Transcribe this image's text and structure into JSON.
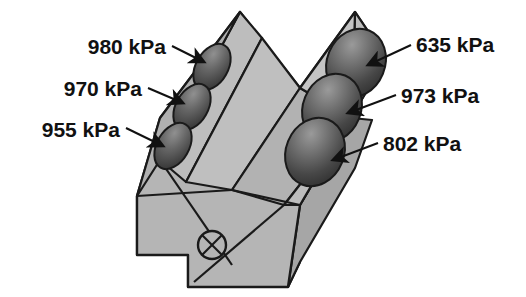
{
  "figure": {
    "type": "engineering-diagram",
    "unit": "kPa",
    "background_color": "#ffffff",
    "body_fill": "#b5b5b5",
    "body_fill_light": "#c4c4c4",
    "body_fill_dark": "#a6a6a6",
    "outline_color": "#1a1a1a",
    "bore_dark": "#3a3a3a",
    "bore_light": "#8e8e8e",
    "text_color": "#111111"
  },
  "annotations": {
    "left_bank": [
      {
        "id": "cyl-left-1",
        "value": "980 kPa",
        "number": 980
      },
      {
        "id": "cyl-left-2",
        "value": "970 kPa",
        "number": 970
      },
      {
        "id": "cyl-left-3",
        "value": "955 kPa",
        "number": 955
      }
    ],
    "right_bank": [
      {
        "id": "cyl-right-1",
        "value": "635 kPa",
        "number": 635
      },
      {
        "id": "cyl-right-2",
        "value": "973 kPa",
        "number": 973
      },
      {
        "id": "cyl-right-3",
        "value": "802 kPa",
        "number": 802
      }
    ]
  },
  "symbols": {
    "crankshaft_axis": "crossed-circle"
  }
}
